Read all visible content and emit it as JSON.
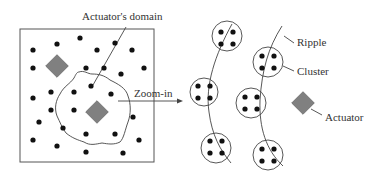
{
  "labels": {
    "domain": "Actuator's domain",
    "zoom": "Zoom-in",
    "ripple": "Ripple",
    "cluster": "Cluster",
    "actuator": "Actuator"
  },
  "colors": {
    "actuator_fill": "#808080",
    "stroke": "#444444",
    "node": "#111111"
  }
}
